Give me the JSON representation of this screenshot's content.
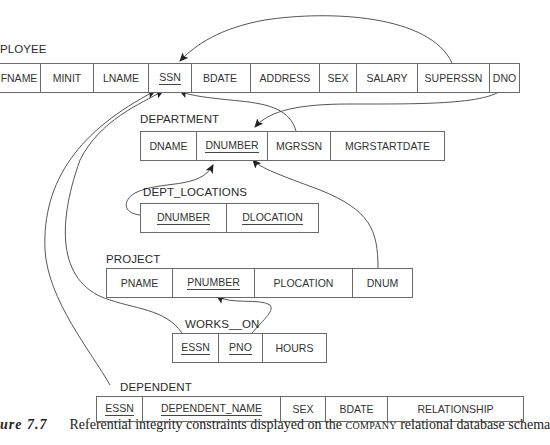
{
  "diagram": {
    "relations": {
      "employee": {
        "label": "PLOYEE",
        "columns": [
          {
            "name": "FNAME",
            "key": false
          },
          {
            "name": "MINIT",
            "key": false
          },
          {
            "name": "LNAME",
            "key": false
          },
          {
            "name": "SSN",
            "key": true
          },
          {
            "name": "BDATE",
            "key": false
          },
          {
            "name": "ADDRESS",
            "key": false
          },
          {
            "name": "SEX",
            "key": false
          },
          {
            "name": "SALARY",
            "key": false
          },
          {
            "name": "SUPERSSN",
            "key": false
          },
          {
            "name": "DNO",
            "key": false
          }
        ]
      },
      "department": {
        "label": "DEPARTMENT",
        "columns": [
          {
            "name": "DNAME",
            "key": false
          },
          {
            "name": "DNUMBER",
            "key": true
          },
          {
            "name": "MGRSSN",
            "key": false
          },
          {
            "name": "MGRSTARTDATE",
            "key": false
          }
        ]
      },
      "dept_locations": {
        "label": "DEPT_LOCATIONS",
        "columns": [
          {
            "name": "DNUMBER",
            "key": true
          },
          {
            "name": "DLOCATION",
            "key": true
          }
        ]
      },
      "project": {
        "label": "PROJECT",
        "columns": [
          {
            "name": "PNAME",
            "key": false
          },
          {
            "name": "PNUMBER",
            "key": true
          },
          {
            "name": "PLOCATION",
            "key": false
          },
          {
            "name": "DNUM",
            "key": false
          }
        ]
      },
      "works_on": {
        "label": "WORKS__ON",
        "columns": [
          {
            "name": "ESSN",
            "key": true
          },
          {
            "name": "PNO",
            "key": true
          },
          {
            "name": "HOURS",
            "key": false
          }
        ]
      },
      "dependent": {
        "label": "DEPENDENT",
        "columns": [
          {
            "name": "ESSN",
            "key": true
          },
          {
            "name": "DEPENDENT_NAME",
            "key": true
          },
          {
            "name": "SEX",
            "key": false
          },
          {
            "name": "BDATE",
            "key": false
          },
          {
            "name": "RELATIONSHIP",
            "key": false
          }
        ]
      }
    },
    "references": [
      {
        "from": "EMPLOYEE.SUPERSSN",
        "to": "EMPLOYEE.SSN"
      },
      {
        "from": "EMPLOYEE.DNO",
        "to": "DEPARTMENT.DNUMBER"
      },
      {
        "from": "DEPARTMENT.MGRSSN",
        "to": "EMPLOYEE.SSN"
      },
      {
        "from": "DEPT_LOCATIONS.DNUMBER",
        "to": "DEPARTMENT.DNUMBER"
      },
      {
        "from": "PROJECT.DNUM",
        "to": "DEPARTMENT.DNUMBER"
      },
      {
        "from": "WORKS_ON.ESSN",
        "to": "EMPLOYEE.SSN"
      },
      {
        "from": "WORKS_ON.PNO",
        "to": "PROJECT.PNUMBER"
      },
      {
        "from": "DEPENDENT.ESSN",
        "to": "EMPLOYEE.SSN"
      }
    ],
    "line_color": "#444444"
  },
  "caption": {
    "figure": "ure 7.7",
    "text_before": "Referential integrity constraints displayed on the ",
    "smallcaps": "COMPANY",
    "text_after": " relational database schema"
  }
}
